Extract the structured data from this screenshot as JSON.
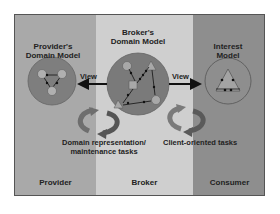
{
  "diagram": {
    "columns": [
      {
        "id": "provider",
        "label": "Provider",
        "color": "#a9a9a9"
      },
      {
        "id": "broker",
        "label": "Broker",
        "color": "#cfcfcf"
      },
      {
        "id": "consumer",
        "label": "Consumer",
        "color": "#8e8e8e"
      }
    ],
    "models": {
      "provider": {
        "title_line1": "Provider's",
        "title_line2": "Domain Model"
      },
      "broker": {
        "title_line1": "Broker's",
        "title_line2": "Domain Model"
      },
      "consumer": {
        "title_line1": "Interest",
        "title_line2": "Model"
      }
    },
    "arrows": {
      "left_view": "View",
      "right_view": "View"
    },
    "tasks": {
      "domain_line1": "Domain representation/",
      "domain_line2": "maintenance tasks",
      "client": "Client-oriented tasks"
    }
  }
}
